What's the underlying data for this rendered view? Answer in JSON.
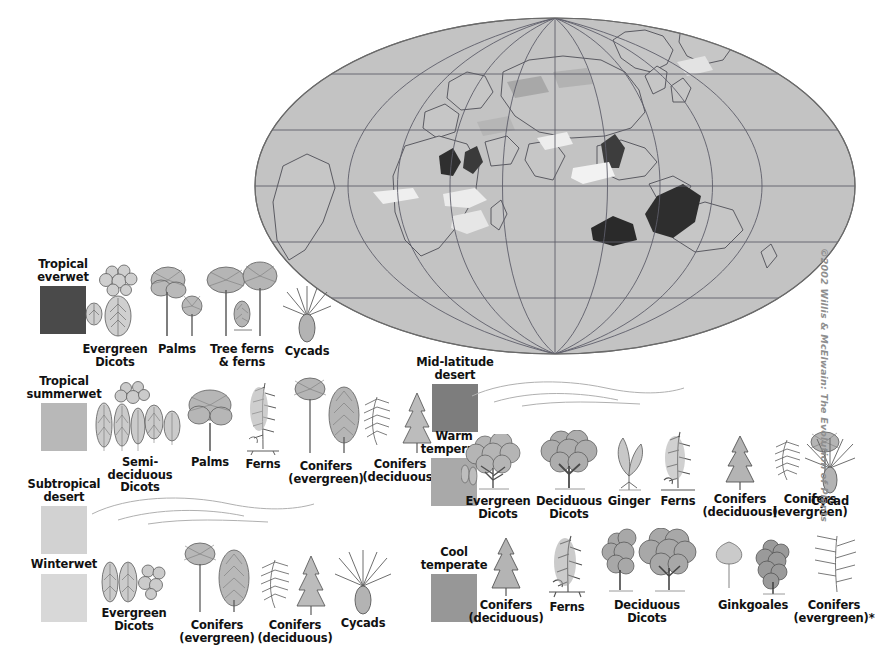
{
  "figure": {
    "credit": "©2002 Willis & McElwain: The Evolution of Plants"
  },
  "map": {
    "name": "world-map-mollweide",
    "projection": "elliptical (Mollweide-style) world map",
    "ocean_color": "#c3c3c3",
    "land_outline_color": "#555555",
    "graticule_color": "#5d5d6a",
    "border_color": "#6a6a6a",
    "vegetation_overlays": [
      {
        "zone": "Tropical everwet",
        "color": "#3f3f3f"
      },
      {
        "zone": "Tropical summerwet",
        "color": "#b5b5b5"
      },
      {
        "zone": "Subtropical desert",
        "color": "#e8e8e8"
      },
      {
        "zone": "Mid-latitude desert",
        "color": "#7d7d7d"
      },
      {
        "zone": "Warm temperate",
        "color": "#a9a9a9"
      },
      {
        "zone": "Cool temperate",
        "color": "#979797"
      },
      {
        "zone": "Winterwet",
        "color": "#dcdcdc"
      }
    ]
  },
  "legend": {
    "rows": [
      {
        "id": "tropical-everwet",
        "zone": {
          "label": "Tropical\neverwet",
          "color": "#4a4a4a"
        },
        "plants": [
          {
            "label": "Evergreen\nDicots",
            "icon": "evergreen-dicots-icon"
          },
          {
            "label": "Palms",
            "icon": "palms-icon"
          },
          {
            "label": "Tree ferns\n& ferns",
            "icon": "tree-ferns-icon"
          },
          {
            "label": "Cycads",
            "icon": "cycads-icon"
          }
        ]
      },
      {
        "id": "tropical-summerwet",
        "zone": {
          "label": "Tropical\nsummerwet",
          "color": "#b8b8b8"
        },
        "plants": [
          {
            "label": "Semi-deciduous\nDicots",
            "icon": "semi-deciduous-dicots-icon"
          },
          {
            "label": "Palms",
            "icon": "palms-icon"
          },
          {
            "label": "Ferns",
            "icon": "ferns-icon"
          },
          {
            "label": "Conifers\n(evergreen)",
            "icon": "conifers-evergreen-icon"
          },
          {
            "label": "Conifers\n(deciduous)",
            "icon": "conifers-deciduous-icon"
          }
        ]
      },
      {
        "id": "subtropical-desert",
        "zone": {
          "label": "Subtropical\ndesert",
          "color": "#d2d2d2"
        },
        "plants": []
      },
      {
        "id": "winterwet",
        "zone": {
          "label": "Winterwet",
          "color": "#d8d8d8"
        },
        "plants": [
          {
            "label": "Evergreen\nDicots",
            "icon": "evergreen-dicots-icon"
          },
          {
            "label": "Conifers\n(evergreen)",
            "icon": "conifers-evergreen-icon"
          },
          {
            "label": "Conifers\n(deciduous)",
            "icon": "conifers-deciduous-icon"
          },
          {
            "label": "Cycads",
            "icon": "cycads-icon"
          }
        ]
      },
      {
        "id": "mid-latitude-desert",
        "zone": {
          "label": "Mid-latitude\ndesert",
          "color": "#7d7d7d"
        },
        "plants": []
      },
      {
        "id": "warm-temperate",
        "zone": {
          "label": "Warm\ntemperate",
          "color": "#a9a9a9"
        },
        "plants": [
          {
            "label": "Evergreen\nDicots",
            "icon": "evergreen-dicots-tree-icon"
          },
          {
            "label": "Deciduous\nDicots",
            "icon": "deciduous-dicots-icon"
          },
          {
            "label": "Ginger",
            "icon": "ginger-icon"
          },
          {
            "label": "Ferns",
            "icon": "ferns-icon"
          },
          {
            "label": "Conifers\n(deciduous)",
            "icon": "conifers-deciduous-icon"
          },
          {
            "label": "Conifers\n(evergreen)",
            "icon": "conifers-evergreen-icon"
          },
          {
            "label": "Cycad",
            "icon": "cycads-icon"
          }
        ]
      },
      {
        "id": "cool-temperate",
        "zone": {
          "label": "Cool\ntemperate",
          "color": "#979797"
        },
        "plants": [
          {
            "label": "Conifers\n(deciduous)",
            "icon": "conifers-deciduous-icon"
          },
          {
            "label": "Ferns",
            "icon": "ferns-icon"
          },
          {
            "label": "Deciduous\nDicots",
            "icon": "deciduous-dicots-icon"
          },
          {
            "label": "Ginkgoales",
            "icon": "ginkgoales-icon"
          },
          {
            "label": "Conifers\n(evergreen)*",
            "icon": "conifers-evergreen-frond-icon"
          }
        ]
      }
    ]
  }
}
